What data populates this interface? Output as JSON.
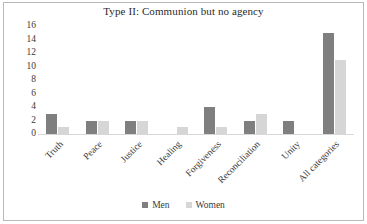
{
  "chart_data": {
    "type": "bar",
    "title": "Type II: Communion but no agency",
    "xlabel": "",
    "ylabel": "",
    "ylim": [
      0,
      16
    ],
    "yticks": [
      16,
      14,
      12,
      10,
      8,
      6,
      4,
      2,
      0
    ],
    "grid": false,
    "legend_position": "bottom",
    "categories": [
      "Truth",
      "Peace",
      "Justice",
      "Healing",
      "Forgiveness",
      "Reconciliation",
      "Unity",
      "All categories"
    ],
    "series": [
      {
        "name": "Men",
        "color": "#7f7f7f",
        "values": [
          3,
          2,
          2,
          0,
          4,
          2,
          2,
          15
        ]
      },
      {
        "name": "Women",
        "color": "#d6d6d6",
        "values": [
          1,
          2,
          2,
          1,
          1,
          3,
          0,
          11
        ]
      }
    ]
  },
  "legend": {
    "items": [
      {
        "label": "Men"
      },
      {
        "label": "Women"
      }
    ]
  },
  "colors": {
    "men": "#7f7f7f",
    "women": "#d6d6d6",
    "text": "#3a3a3a",
    "frame": "#b9b9b9"
  }
}
